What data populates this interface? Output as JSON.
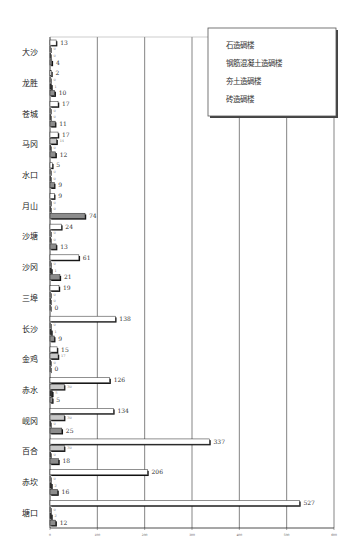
{
  "chart_data": {
    "type": "bar",
    "orientation": "horizontal",
    "title": "",
    "xlabel": "",
    "ylabel": "",
    "xlim": [
      0,
      600
    ],
    "xticks": [
      0,
      100,
      200,
      300,
      400,
      500,
      600
    ],
    "grid": "vertical",
    "legend_position": "top-right",
    "categories": [
      "大沙",
      "龙胜",
      "苍城",
      "马冈",
      "水口",
      "月山",
      "沙塘",
      "沙冈",
      "三埠",
      "长沙",
      "金鸡",
      "赤水",
      "岘冈",
      "百合",
      "赤坎",
      "塘口"
    ],
    "series": [
      {
        "name": "石造碉楼",
        "color": "#ffffff",
        "values": [
          13,
          2,
          17,
          17,
          5,
          9,
          24,
          61,
          19,
          138,
          15,
          126,
          134,
          337,
          206,
          527
        ]
      },
      {
        "name": "钢筋混凝土造碉楼",
        "color": "#c8c8c8",
        "values": [
          0,
          0,
          0,
          14,
          0,
          0,
          0,
          0,
          0,
          0,
          17,
          30,
          30,
          30,
          0,
          0
        ]
      },
      {
        "name": "夯土造碉楼",
        "color": "#333333",
        "values": [
          0,
          1,
          0,
          0,
          0,
          0,
          0,
          1,
          0,
          1,
          0,
          5,
          0,
          0,
          2,
          2
        ]
      },
      {
        "name": "砖造碉楼",
        "color": "#8c8c8c",
        "values": [
          4,
          10,
          11,
          12,
          9,
          74,
          13,
          21,
          0,
          9,
          0,
          5,
          25,
          18,
          16,
          12
        ]
      }
    ],
    "labeled_series_indices": [
      0,
      3
    ]
  },
  "legend": {
    "items": [
      "石造碉楼",
      "钢筋混凝土造碉楼",
      "夯土造碉楼",
      "砖造碉楼"
    ]
  }
}
